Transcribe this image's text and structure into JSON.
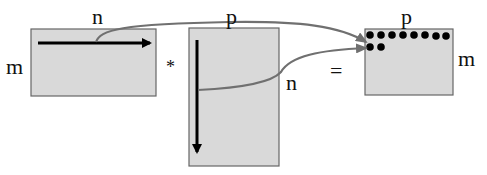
{
  "diagram": {
    "type": "matrix-multiplication",
    "colors": {
      "matrix_fill": "#d9d9d9",
      "matrix_border": "#666666",
      "arrow": "#000000",
      "connector": "#707070",
      "dot": "#000000"
    },
    "matrices": [
      {
        "id": "A",
        "rows_label": "m",
        "cols_label": "n",
        "traversal": "row (left to right)"
      },
      {
        "id": "B",
        "rows_label": "n",
        "cols_label": "p",
        "traversal": "column (top to bottom)"
      },
      {
        "id": "C",
        "rows_label": "m",
        "cols_label": "p",
        "filled_dots_row1": 8,
        "filled_dots_row2": 2
      }
    ],
    "operators": {
      "multiply": "*",
      "equals": "="
    },
    "labels": {
      "a_cols": "n",
      "a_rows": "m",
      "b_cols": "p",
      "b_rows": "n",
      "c_cols": "p",
      "c_rows": "m"
    }
  }
}
